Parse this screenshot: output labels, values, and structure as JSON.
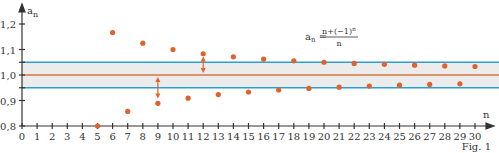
{
  "chart_data": {
    "type": "scatter",
    "title": "",
    "formula": {
      "lhs": "a",
      "lhs_sub": "n",
      "numerator": "n+(−1)",
      "numerator_sup": "n",
      "denominator": "n"
    },
    "ylabel": "a",
    "ylabel_sub": "n",
    "xlabel": "n",
    "caption": "Fig. 1",
    "xlim": [
      0,
      30
    ],
    "ylim": [
      0.8,
      1.2
    ],
    "x_ticks": [
      0,
      1,
      2,
      3,
      4,
      5,
      6,
      7,
      8,
      9,
      10,
      11,
      12,
      13,
      14,
      15,
      16,
      17,
      18,
      19,
      20,
      21,
      22,
      23,
      24,
      25,
      26,
      27,
      28,
      29,
      30
    ],
    "y_ticks": [
      0.8,
      0.9,
      1.0,
      1.1,
      1.2
    ],
    "y_tick_labels": [
      "0,8",
      "0,9",
      "1,0",
      "1,1",
      "1,2"
    ],
    "limit_line": 1.0,
    "epsilon_band": [
      0.95,
      1.05
    ],
    "series": [
      {
        "name": "a_n",
        "x": [
          5,
          6,
          7,
          8,
          9,
          10,
          11,
          12,
          13,
          14,
          15,
          16,
          17,
          18,
          19,
          20,
          21,
          22,
          23,
          24,
          25,
          26,
          27,
          28,
          29,
          30
        ],
        "values": [
          0.8,
          1.1667,
          0.8571,
          1.125,
          0.8889,
          1.1,
          0.9091,
          1.0833,
          0.9231,
          1.0714,
          0.9333,
          1.0625,
          0.9412,
          1.0556,
          0.9474,
          1.05,
          0.9524,
          1.0455,
          0.9565,
          1.0417,
          0.96,
          1.0385,
          0.963,
          1.0357,
          0.9655,
          1.0333
        ]
      }
    ],
    "annotations": [
      {
        "type": "double-arrow",
        "x": 9,
        "from": 0.9,
        "to": 1.0
      },
      {
        "type": "double-arrow",
        "x": 12,
        "from": 1.0,
        "to": 1.08
      }
    ],
    "colors": {
      "points": "#e0622a",
      "limit": "#d9773f",
      "band_lines": "#2a9fd6",
      "band_fill": "#ececec",
      "axis": "#333333"
    }
  }
}
